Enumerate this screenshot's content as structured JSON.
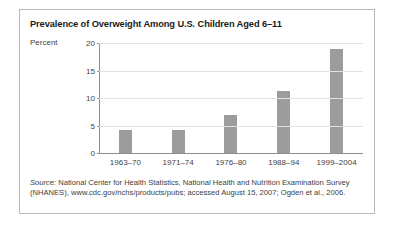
{
  "figure": {
    "title": "Prevalence of Overweight Among U.S. Children Aged 6–11",
    "source_label": "Source:",
    "source_text": " National Center for Health Statistics, National Health and Nutrition Examination Survey (NHANES), www.cdc.gov/nchs/products/pubs; accessed August 15, 2007; Ogden et al., 2006."
  },
  "colors": {
    "bar": "#9c9c9c",
    "gridline": "#e2e2e2",
    "axis": "#8e8e8e",
    "border": "#b9b9b9",
    "text": "#3f3f3f",
    "title": "#1b1b1b"
  },
  "chart_data": {
    "type": "bar",
    "title": "Prevalence of Overweight Among U.S. Children Aged 6–11",
    "xlabel": "",
    "ylabel": "Percent",
    "categories": [
      "1963–70",
      "1971–74",
      "1976–80",
      "1988–94",
      "1999–2004"
    ],
    "values": [
      4.2,
      4.2,
      7,
      11.3,
      19
    ],
    "ylim": [
      0,
      20
    ],
    "yticks": [
      0,
      5,
      10,
      15,
      20
    ],
    "ytick_labels": [
      "0",
      "5",
      "10",
      "15",
      "20"
    ],
    "grid": true,
    "legend": false
  }
}
